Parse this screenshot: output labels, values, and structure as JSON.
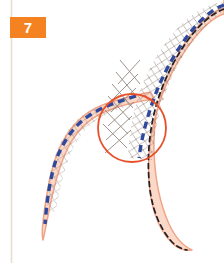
{
  "figure": {
    "step_badge": {
      "label": "7",
      "background_color": "#f58220",
      "text_color": "#ffffff"
    },
    "background_color": "#ffffff",
    "margin_rule": {
      "name": "left-margin-line",
      "color": "#e8dfcf",
      "x": 11,
      "y_start": 0,
      "y_end": 263
    },
    "colors": {
      "vessel_fill": "#fbd9c9",
      "vessel_wall": "#f0a488",
      "stent_marker_blue": "#2f4a9c",
      "guidewire_black": "#231f20",
      "highlight_circle": "#e8502a",
      "stent_strut": "#8a7a72"
    },
    "elements": [
      {
        "name": "main-vessel",
        "description": "Main coronary artery curving from top-right down through the bifurcation to the bottom-right",
        "fill": "#fbd9c9",
        "wall": "#f0a488"
      },
      {
        "name": "side-branch-vessel",
        "description": "Side branch vessel tapering from the bifurcation down to the lower-left",
        "fill": "#fbd9c9",
        "wall": "#f0a488"
      },
      {
        "name": "stent-mesh",
        "description": "Deployed stent crosshatch struts spanning the bifurcation in the main vessel",
        "color": "#8a7a72"
      },
      {
        "name": "stent-balloon-blue-dashed",
        "description": "Blue dashed stent/balloon marker line through main vessel and side branch",
        "color": "#2f4a9c"
      },
      {
        "name": "guidewire-black-dashed",
        "description": "Black dashed guidewire running the length of the main vessel",
        "color": "#231f20"
      },
      {
        "name": "highlight-circle",
        "description": "Red circle highlighting the bifurcation carina region",
        "color": "#e8502a",
        "center_x": 132,
        "center_y": 128,
        "radius": 34
      }
    ]
  }
}
